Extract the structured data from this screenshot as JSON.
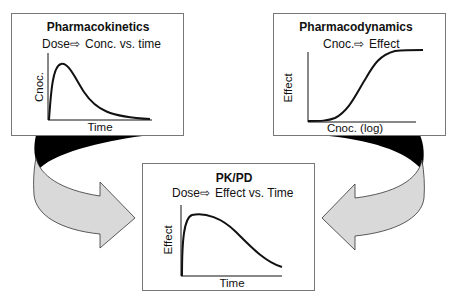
{
  "diagram": {
    "panels": {
      "pk": {
        "title": "Pharmacokinetics",
        "relation_left": "Dose",
        "relation_right": "Conc. vs. time",
        "xlabel": "Time",
        "ylabel": "Cnoc."
      },
      "pd": {
        "title": "Pharmacodynamics",
        "relation_left": "Cnoc.",
        "relation_right": "Effect",
        "xlabel": "Cnoc. (log)",
        "ylabel": "Effect"
      },
      "pkpd": {
        "title": "PK/PD",
        "relation_left": "Dose",
        "relation_right": "Effect vs. Time",
        "xlabel": "Time",
        "ylabel": "Effect"
      }
    },
    "relation_arrow_glyph": "⇨",
    "connectors": [
      {
        "from": "pk",
        "to": "pkpd",
        "style": "curved-arrow"
      },
      {
        "from": "pd",
        "to": "pkpd",
        "style": "curved-arrow"
      }
    ],
    "colors": {
      "box_border": "#777777",
      "curve": "#111111",
      "arrow_fill": "#d9d9d9",
      "arrow_shadow": "#000000",
      "background": "#ffffff"
    }
  }
}
